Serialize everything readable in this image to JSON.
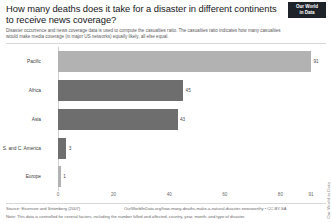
{
  "header": {
    "title": "How many deaths does it take for a disaster in different continents to receive news coverage?",
    "subtitle": "Disaster occurrence and news coverage data is used to compute the casualties ratio. The casualties ratio indicates how many casualties would make media coverage (in major US networks) equally likely, all else equal.",
    "logo_line1": "Our World",
    "logo_line2": "in Data"
  },
  "footer": {
    "source": "Source: Eisensee and Strömberg (2007)",
    "owid_link": "OurWorldInData.org/how-many-deaths-make-a-natural-disaster-newsworthy • CC BY-SA",
    "note": "Note: This data is controlled for several factors, including the number killed and affected, country, year, month, and type of disaster.",
    "watermark": "Our World in Data"
  },
  "chart_data": {
    "type": "bar",
    "orientation": "horizontal",
    "title": "How many deaths does it take for a disaster in different continents to receive news coverage?",
    "xlabel": "",
    "ylabel": "",
    "xlim": [
      0,
      91
    ],
    "xticks": [
      0,
      20,
      40,
      60,
      80,
      91
    ],
    "xtick_labels": [
      "0",
      "20",
      "40",
      "60",
      "80",
      "91"
    ],
    "grid": false,
    "legend": "none",
    "categories": [
      "Pacific",
      "Africa",
      "Asia",
      "S. and C. America",
      "Europe"
    ],
    "values": [
      91,
      45,
      43,
      3,
      1
    ],
    "value_labels": [
      "91",
      "45",
      "43",
      "3",
      "1"
    ],
    "colors": [
      "#b2b2b2",
      "#6e6e6e",
      "#6e6e6e",
      "#6e6e6e",
      "#b2b2b2"
    ],
    "bars": [
      {
        "category": "Pacific",
        "value": 91,
        "label": "91",
        "style": "light"
      },
      {
        "category": "Africa",
        "value": 45,
        "label": "45",
        "style": "dark"
      },
      {
        "category": "Asia",
        "value": 43,
        "label": "43",
        "style": "dark"
      },
      {
        "category": "S. and C. America",
        "value": 3,
        "label": "3",
        "style": "dark"
      },
      {
        "category": "Europe",
        "value": 1,
        "label": "1",
        "style": "light"
      }
    ]
  }
}
